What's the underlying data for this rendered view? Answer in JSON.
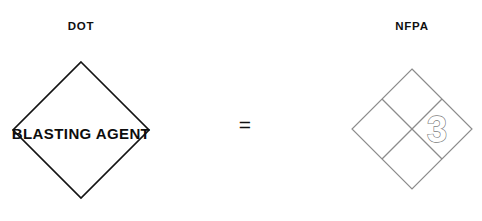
{
  "figure": {
    "width": 482,
    "height": 221,
    "background_color": "#ffffff",
    "equals_sign": "="
  },
  "dot": {
    "heading": "DOT",
    "placard": {
      "shape": "diamond",
      "label": "BLASTING AGENT",
      "border_color": "#141414",
      "fill_color": "#ffffff",
      "text_color": "#0d0d0d"
    }
  },
  "nfpa": {
    "heading": "NFPA",
    "placard": {
      "shape": "diamond-quartered",
      "border_color": "#8c8c8c",
      "fill_color": "#ffffff",
      "quadrants": [
        {
          "position": "top",
          "name": "health",
          "value": ""
        },
        {
          "position": "left",
          "name": "flammability",
          "value": ""
        },
        {
          "position": "right",
          "name": "instability",
          "value": "3"
        },
        {
          "position": "bottom",
          "name": "special",
          "value": ""
        }
      ],
      "rating_value": "3",
      "rating_outline_color": "#7d7d7d"
    }
  }
}
